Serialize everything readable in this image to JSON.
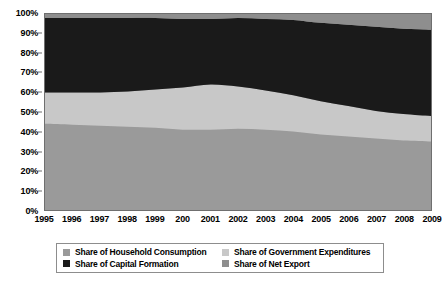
{
  "chart_data": {
    "type": "area",
    "stacked": true,
    "normalized": "100%",
    "title": "",
    "subtitle": "",
    "xlabel": "",
    "ylabel": "",
    "ylim": [
      0,
      100
    ],
    "grid": false,
    "legend_position": "bottom",
    "x": [
      1995,
      1996,
      1997,
      1998,
      1999,
      2000,
      2001,
      2002,
      2003,
      2004,
      2005,
      2006,
      2007,
      2008,
      2009
    ],
    "categories": [
      "1995",
      "1996",
      "1997",
      "1998",
      "1999",
      "200",
      "2001",
      "2002",
      "2003",
      "2004",
      "2005",
      "2006",
      "2007",
      "2008",
      "2009"
    ],
    "ytick_labels": [
      "0%",
      "10%",
      "20%",
      "30%",
      "40%",
      "50%",
      "60%",
      "70%",
      "80%",
      "90%",
      "100%"
    ],
    "ytick_values": [
      0,
      10,
      20,
      30,
      40,
      50,
      60,
      70,
      80,
      90,
      100
    ],
    "series": [
      {
        "name": "Share of Household Consumption",
        "color": "#9a9a9a",
        "values": [
          44,
          43.5,
          43,
          42.5,
          42,
          41,
          41,
          41.5,
          41,
          40,
          38.5,
          37.5,
          36.5,
          35.5,
          35
        ]
      },
      {
        "name": "Share of Government Expenditures",
        "color": "#c8c8c8",
        "values": [
          16,
          16.5,
          17,
          18,
          19.5,
          21.5,
          23,
          21.5,
          20,
          18.5,
          17,
          15.5,
          14,
          13.5,
          13
        ]
      },
      {
        "name": "Share of Capital Formation",
        "color": "#1a1a1a",
        "values": [
          38,
          38,
          38,
          37.5,
          36.5,
          35,
          33.5,
          35,
          36.5,
          38.5,
          40,
          41.5,
          43,
          43.5,
          44
        ]
      },
      {
        "name": "Share of Net Export",
        "color": "#8e8e8e",
        "values": [
          2,
          2,
          2,
          2,
          2,
          2.5,
          2.5,
          2,
          2.5,
          3,
          4.5,
          5.5,
          6.5,
          7.5,
          8
        ]
      }
    ],
    "boundaries_cumulative": {
      "household_top": [
        44,
        43.5,
        43,
        42.5,
        42,
        41,
        41,
        41.5,
        41,
        40,
        38.5,
        37.5,
        36.5,
        35.5,
        35
      ],
      "government_top": [
        60,
        60,
        60,
        60.5,
        61.5,
        62.5,
        64,
        63,
        61,
        58.5,
        55.5,
        53,
        50.5,
        49,
        48
      ],
      "capital_top": [
        98,
        98,
        98,
        98,
        98,
        97.5,
        97.5,
        98,
        97.5,
        97,
        95.5,
        94.5,
        93.5,
        92.5,
        92
      ],
      "net_export_top": [
        100,
        100,
        100,
        100,
        100,
        100,
        100,
        100,
        100,
        100,
        100,
        100,
        100,
        100,
        100
      ]
    }
  },
  "legend": {
    "items": [
      {
        "label": "Share of Household Consumption",
        "color": "#9a9a9a"
      },
      {
        "label": "Share of Government Expenditures",
        "color": "#c8c8c8"
      },
      {
        "label": "Share of Capital Formation",
        "color": "#1a1a1a"
      },
      {
        "label": "Share of Net Export",
        "color": "#8e8e8e"
      }
    ]
  },
  "colors": {
    "axis": "#6f6f6f",
    "text": "#000000",
    "background": "#ffffff",
    "legend_border": "#8d8d8d"
  }
}
